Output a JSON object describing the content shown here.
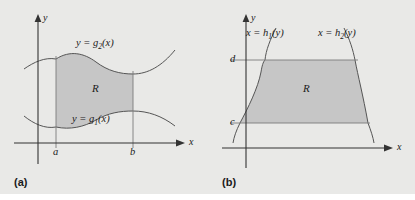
{
  "figure": {
    "background_color": "#e9e9e7",
    "region_fill_color": "#c6c6c6",
    "curve_color": "#555555",
    "axis_color": "#333333"
  },
  "panels": [
    {
      "id": "a",
      "caption": "(a)",
      "axes": {
        "x_label": "x",
        "y_label": "y"
      },
      "region_label": "R",
      "curve_upper": {
        "text_prefix": "y = g",
        "subscript": "2",
        "text_suffix": "(x)"
      },
      "curve_lower": {
        "text_prefix": "y = g",
        "subscript": "1",
        "text_suffix": "(x)"
      },
      "ticks": [
        {
          "name": "a",
          "label": "a"
        },
        {
          "name": "b",
          "label": "b"
        }
      ]
    },
    {
      "id": "b",
      "caption": "(b)",
      "axes": {
        "x_label": "x",
        "y_label": "y"
      },
      "region_label": "R",
      "curve_left": {
        "text_prefix": "x = h",
        "subscript": "1",
        "text_suffix": "(y)"
      },
      "curve_right": {
        "text_prefix": "x = h",
        "subscript": "2",
        "text_suffix": "(y)"
      },
      "ticks": [
        {
          "name": "d",
          "label": "d"
        },
        {
          "name": "c",
          "label": "c"
        }
      ]
    }
  ]
}
